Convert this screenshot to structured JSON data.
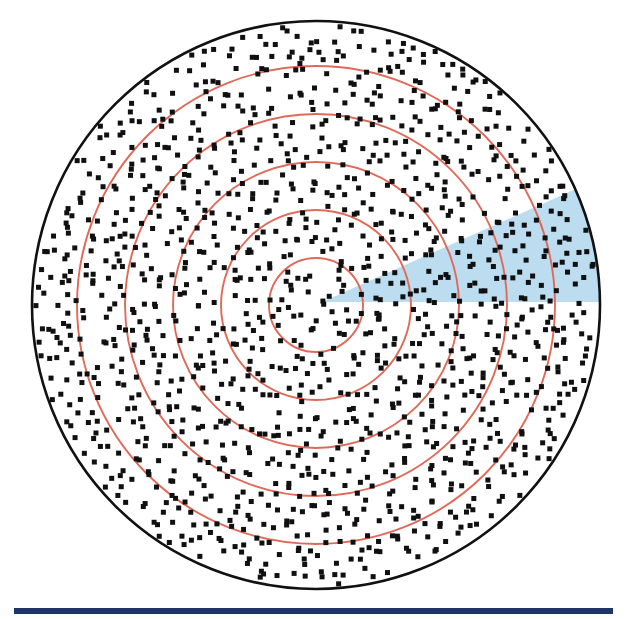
{
  "figure": {
    "title": "Concentric range-ring diagram with sampled point field and highlighted angular sector",
    "background_color": "#ffffff",
    "width": 627,
    "height": 619
  },
  "chart_data": {
    "type": "scatter",
    "title": "Concentric range-ring diagram with sampled point field and highlighted angular sector",
    "subtitle": "",
    "xlabel": "",
    "ylabel": "",
    "grid": false,
    "legend_position": "none",
    "axis_visible": false,
    "tick_labels": [],
    "annotations": [],
    "coordinate_system": "polar",
    "center": {
      "x": 316,
      "y": 305
    },
    "boundary": {
      "name": "outer-boundary-circle",
      "shape": "circle",
      "radius": 284,
      "stroke_color": "#111111",
      "stroke_width": 2.6,
      "fill_color": "#ffffff"
    },
    "rings": {
      "name": "range-rings",
      "count": 5,
      "stroke_color": "#e06a5a",
      "stroke_width": 1.9,
      "fill": "none",
      "radii": [
        47,
        95,
        143,
        191,
        239
      ],
      "ring_labels": [
        "r1",
        "r2",
        "r3",
        "r4",
        "r5"
      ]
    },
    "sector": {
      "name": "highlighted-sector",
      "shape": "wedge",
      "fill_color": "#bcdcef",
      "opacity": 1,
      "apex": {
        "x": 322,
        "y": 302
      },
      "start_angle_deg": 0,
      "end_angle_deg": 24,
      "radius": 284,
      "direction_label": "upper-right"
    },
    "points": {
      "name": "point-field",
      "marker": "square",
      "marker_size_px": 5,
      "color": "#101010",
      "approx_count": 1450,
      "distribution": "uniform-random within boundary circle",
      "mean_spacing_px": 13,
      "seed": 20240517
    },
    "footer_rule": {
      "name": "footer-rule",
      "shape": "rectangle",
      "color": "#1f3566",
      "x": 14,
      "y": 608,
      "width": 599,
      "height": 6
    }
  }
}
